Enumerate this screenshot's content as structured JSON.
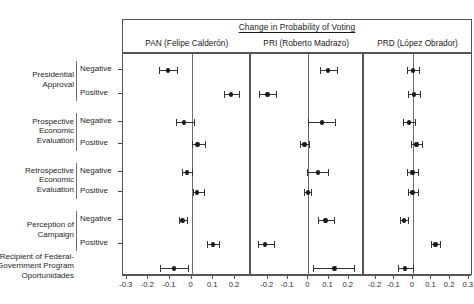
{
  "chart_data": {
    "type": "scatter",
    "title": "Change in Probability of Voting",
    "xlabel": "",
    "ylabel": "",
    "grid": false,
    "legend": false,
    "panels": [
      {
        "key": "pan",
        "label": "PAN (Felipe Calderón)",
        "xlim": [
          -0.31,
          0.265
        ],
        "ticks": [
          -0.3,
          -0.2,
          -0.1,
          0,
          0.1,
          0.2
        ],
        "tick_labels": [
          "-0.3",
          "-0.2",
          "-0.1",
          "0",
          "0.1",
          "0.2"
        ]
      },
      {
        "key": "pri",
        "label": "PRI (Roberto Madrazo)",
        "xlim": [
          -0.285,
          0.265
        ],
        "ticks": [
          -0.2,
          -0.1,
          0,
          0.1,
          0.2
        ],
        "tick_labels": [
          "-0.2",
          "-0.1",
          "0",
          "0.1",
          "0.2"
        ]
      },
      {
        "key": "prd",
        "label": "PRD (López Obrador)",
        "xlim": [
          -0.265,
          0.315
        ],
        "ticks": [
          -0.2,
          -0.1,
          0,
          0.1,
          0.2,
          0.3
        ],
        "tick_labels": [
          "-0.2",
          "-0.1",
          "0",
          "0.1",
          "0.2",
          "0.3"
        ]
      }
    ],
    "groups": [
      {
        "name": "Presidential Approval",
        "lines": [
          "Presidential",
          "Approval"
        ]
      },
      {
        "name": "Prospective Economic Evaluation",
        "lines": [
          "Prospective",
          "Economic",
          "Evaluation"
        ]
      },
      {
        "name": "Retrospective Economic Evaluation",
        "lines": [
          "Retrospective",
          "Economic",
          "Evaluation"
        ]
      },
      {
        "name": "Perception of Campaign",
        "lines": [
          "Perception of",
          "Campaign"
        ]
      },
      {
        "name": "Recipient of Federal-Government Program Oportunidades",
        "lines": [
          "Recipient of Federal-",
          "Government Program",
          "Oportunidades"
        ]
      }
    ],
    "rows": [
      {
        "group": 0,
        "label": "Negative",
        "pan": {
          "estimate": -0.108,
          "lo": -0.15,
          "hi": -0.068
        },
        "pri": {
          "estimate": 0.098,
          "lo": 0.058,
          "hi": 0.14
        },
        "prd": {
          "estimate": 0.0,
          "lo": -0.03,
          "hi": 0.032
        }
      },
      {
        "group": 0,
        "label": "Positive",
        "pan": {
          "estimate": 0.181,
          "lo": 0.148,
          "hi": 0.218
        },
        "pri": {
          "estimate": -0.202,
          "lo": -0.242,
          "hi": -0.16
        },
        "prd": {
          "estimate": 0.006,
          "lo": -0.025,
          "hi": 0.038
        }
      },
      {
        "group": 1,
        "label": "Negative",
        "pan": {
          "estimate": -0.035,
          "lo": -0.07,
          "hi": 0.01
        },
        "pri": {
          "estimate": 0.068,
          "lo": 0.0,
          "hi": 0.132
        },
        "prd": {
          "estimate": -0.022,
          "lo": -0.052,
          "hi": 0.01
        }
      },
      {
        "group": 1,
        "label": "Positive",
        "pan": {
          "estimate": 0.028,
          "lo": 0.0,
          "hi": 0.062
        },
        "pri": {
          "estimate": -0.018,
          "lo": -0.042,
          "hi": 0.005
        },
        "prd": {
          "estimate": 0.02,
          "lo": -0.01,
          "hi": 0.05
        }
      },
      {
        "group": 2,
        "label": "Negative",
        "pan": {
          "estimate": -0.022,
          "lo": -0.045,
          "hi": 0.002
        },
        "pri": {
          "estimate": 0.048,
          "lo": -0.005,
          "hi": 0.098
        },
        "prd": {
          "estimate": -0.002,
          "lo": -0.03,
          "hi": 0.026
        }
      },
      {
        "group": 2,
        "label": "Positive",
        "pan": {
          "estimate": 0.025,
          "lo": 0.005,
          "hi": 0.055
        },
        "pri": {
          "estimate": 0.0,
          "lo": -0.02,
          "hi": 0.013
        },
        "prd": {
          "estimate": -0.002,
          "lo": -0.026,
          "hi": 0.026
        }
      },
      {
        "group": 3,
        "label": "Negative",
        "pan": {
          "estimate": -0.042,
          "lo": -0.06,
          "hi": -0.02
        },
        "pri": {
          "estimate": 0.085,
          "lo": 0.048,
          "hi": 0.125
        },
        "prd": {
          "estimate": -0.048,
          "lo": -0.068,
          "hi": -0.028
        }
      },
      {
        "group": 3,
        "label": "Positive",
        "pan": {
          "estimate": 0.1,
          "lo": 0.072,
          "hi": 0.128
        },
        "pri": {
          "estimate": -0.212,
          "lo": -0.248,
          "hi": -0.168
        },
        "prd": {
          "estimate": 0.122,
          "lo": 0.098,
          "hi": 0.148
        }
      },
      {
        "group": 4,
        "label": "",
        "pan": {
          "estimate": -0.082,
          "lo": -0.148,
          "hi": -0.018
        },
        "pri": {
          "estimate": 0.13,
          "lo": 0.022,
          "hi": 0.225
        },
        "prd": {
          "estimate": -0.042,
          "lo": -0.082,
          "hi": 0.0
        }
      }
    ]
  }
}
